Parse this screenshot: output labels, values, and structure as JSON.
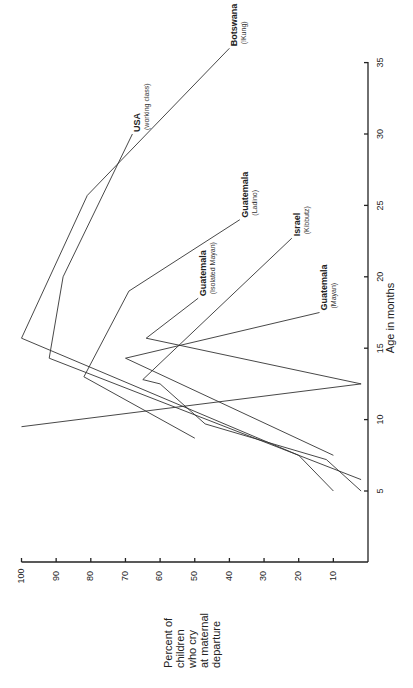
{
  "chart_data": {
    "type": "line",
    "orientation": "rotated 90deg counter-clockwise (age axis vertical, percent axis horizontal)",
    "title": "",
    "xlabel": "Age in months",
    "ylabel": "Percent of children who cry at maternal departure",
    "ylabel_lines": [
      "Percent of",
      "children",
      "who cry",
      "at maternal",
      "departure"
    ],
    "x_ticks": [
      5,
      10,
      15,
      20,
      25,
      30,
      35
    ],
    "y_ticks": [
      10,
      20,
      30,
      40,
      50,
      60,
      70,
      80,
      90,
      100
    ],
    "xlim": [
      0,
      36
    ],
    "ylim": [
      0,
      100
    ],
    "grid": false,
    "legend": "inline labels at series ends",
    "series": [
      {
        "name": "Botswana",
        "subname": "(!Kung)",
        "x": [
          5,
          7.5,
          15.7,
          25.7,
          36
        ],
        "y": [
          10,
          20,
          100,
          81,
          40
        ]
      },
      {
        "name": "USA",
        "subname": "(working class)",
        "x": [
          5.8,
          14.3,
          20,
          30
        ],
        "y": [
          2,
          92,
          88,
          68
        ]
      },
      {
        "name": "Guatemala",
        "subname": "(Ladino)",
        "x": [
          8.7,
          13,
          19,
          24
        ],
        "y": [
          50,
          82,
          69,
          37
        ]
      },
      {
        "name": "Guatemala",
        "subname": "(Isolated Mayan)",
        "x": [
          9.5,
          12.5,
          15.7,
          18.5
        ],
        "y": [
          100,
          2,
          64,
          49
        ]
      },
      {
        "name": "Israel",
        "subname": "(Kibbutz)",
        "x": [
          5,
          7.2,
          9.7,
          12.5,
          12.8,
          22.7
        ],
        "y": [
          2,
          12,
          47,
          60,
          65,
          22
        ]
      },
      {
        "name": "Guatemala",
        "subname": "(Mayan)",
        "x": [
          7.5,
          14.3,
          17.5
        ],
        "y": [
          10,
          70,
          14
        ]
      }
    ]
  }
}
